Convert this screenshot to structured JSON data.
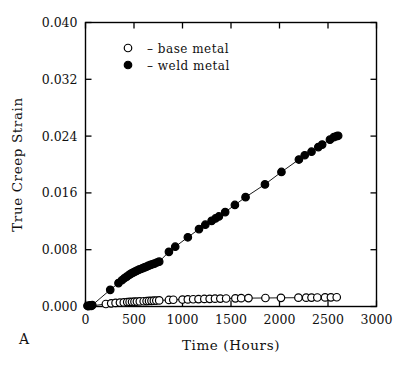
{
  "figure": {
    "panel_label": "A",
    "background_color": "#ffffff",
    "foreground_color": "#000000"
  },
  "chart_data": {
    "type": "scatter",
    "title": "",
    "xlabel": "Time (Hours)",
    "ylabel": "True Creep Strain",
    "xlim": [
      0,
      3000
    ],
    "ylim": [
      0.0,
      0.04
    ],
    "xticks": [
      0,
      500,
      1000,
      1500,
      2000,
      2500,
      3000
    ],
    "xtick_labels": [
      "0",
      "500",
      "1000",
      "1500",
      "2000",
      "2500",
      "3000"
    ],
    "yticks": [
      0.0,
      0.008,
      0.016,
      0.024,
      0.032,
      0.04
    ],
    "ytick_labels": [
      "0.000",
      "0.008",
      "0.016",
      "0.024",
      "0.032",
      "0.040"
    ],
    "grid": false,
    "legend_position": "upper left",
    "tick_direction": "in",
    "series": [
      {
        "name": "base metal",
        "legend_label": "–  base metal",
        "marker": "open-circle",
        "marker_size": 7.5,
        "color": "#000000",
        "fill": "#ffffff",
        "line": true,
        "points": [
          [
            30,
            5e-05
          ],
          [
            60,
            8e-05
          ],
          [
            210,
            0.00035
          ],
          [
            265,
            0.00045
          ],
          [
            310,
            0.0005
          ],
          [
            355,
            0.00055
          ],
          [
            395,
            0.00058
          ],
          [
            430,
            0.00062
          ],
          [
            455,
            0.00064
          ],
          [
            480,
            0.00066
          ],
          [
            505,
            0.00068
          ],
          [
            530,
            0.0007
          ],
          [
            560,
            0.00072
          ],
          [
            600,
            0.00074
          ],
          [
            630,
            0.00076
          ],
          [
            655,
            0.00078
          ],
          [
            680,
            0.0008
          ],
          [
            705,
            0.00082
          ],
          [
            730,
            0.00084
          ],
          [
            760,
            0.00086
          ],
          [
            860,
            0.00092
          ],
          [
            905,
            0.00095
          ],
          [
            1000,
            0.00098
          ],
          [
            1055,
            0.001
          ],
          [
            1110,
            0.00102
          ],
          [
            1165,
            0.00104
          ],
          [
            1225,
            0.00106
          ],
          [
            1280,
            0.00108
          ],
          [
            1335,
            0.0011
          ],
          [
            1390,
            0.00112
          ],
          [
            1450,
            0.00113
          ],
          [
            1545,
            0.00115
          ],
          [
            1605,
            0.00117
          ],
          [
            1680,
            0.00118
          ],
          [
            1855,
            0.0012
          ],
          [
            2015,
            0.00122
          ],
          [
            2195,
            0.00124
          ],
          [
            2275,
            0.00125
          ],
          [
            2330,
            0.00126
          ],
          [
            2390,
            0.00127
          ],
          [
            2470,
            0.00128
          ],
          [
            2530,
            0.00129
          ],
          [
            2590,
            0.0013
          ]
        ]
      },
      {
        "name": "weld metal",
        "legend_label": "–  weld metal",
        "marker": "filled-circle",
        "marker_size": 7.5,
        "color": "#000000",
        "fill": "#000000",
        "line": true,
        "points": [
          [
            20,
            0.0001
          ],
          [
            45,
            0.00015
          ],
          [
            70,
            0.0002
          ],
          [
            255,
            0.00235
          ],
          [
            340,
            0.0033
          ],
          [
            375,
            0.0037
          ],
          [
            400,
            0.00398
          ],
          [
            425,
            0.0042
          ],
          [
            450,
            0.00445
          ],
          [
            470,
            0.00462
          ],
          [
            490,
            0.00478
          ],
          [
            510,
            0.00492
          ],
          [
            530,
            0.00505
          ],
          [
            550,
            0.00518
          ],
          [
            570,
            0.00528
          ],
          [
            590,
            0.0054
          ],
          [
            610,
            0.00552
          ],
          [
            630,
            0.00562
          ],
          [
            650,
            0.00575
          ],
          [
            670,
            0.00585
          ],
          [
            690,
            0.00595
          ],
          [
            710,
            0.00605
          ],
          [
            735,
            0.0062
          ],
          [
            760,
            0.00632
          ],
          [
            860,
            0.0077
          ],
          [
            925,
            0.00842
          ],
          [
            1055,
            0.00975
          ],
          [
            1170,
            0.0109
          ],
          [
            1235,
            0.01152
          ],
          [
            1300,
            0.01205
          ],
          [
            1340,
            0.0124
          ],
          [
            1375,
            0.01268
          ],
          [
            1440,
            0.0133
          ],
          [
            1540,
            0.0143
          ],
          [
            1650,
            0.0154
          ],
          [
            1850,
            0.0172
          ],
          [
            2020,
            0.01895
          ],
          [
            2200,
            0.0207
          ],
          [
            2260,
            0.0213
          ],
          [
            2330,
            0.0218
          ],
          [
            2400,
            0.02245
          ],
          [
            2440,
            0.0228
          ],
          [
            2520,
            0.0235
          ],
          [
            2560,
            0.02385
          ],
          [
            2590,
            0.024
          ],
          [
            2605,
            0.02405
          ]
        ]
      }
    ]
  }
}
